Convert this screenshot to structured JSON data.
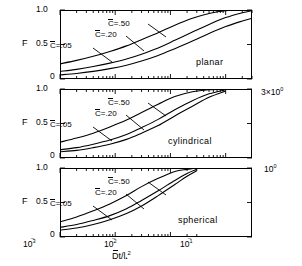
{
  "figure": {
    "type": "multi-panel-line-chart",
    "background": "#ffffff",
    "ink": "#000000",
    "x_axis_title": "D̄t/lₑ²",
    "y_axis_label": "F",
    "y_ticks": [
      "0",
      "0.5",
      "1.0"
    ],
    "x_ticks": [
      "10⁻³",
      "10⁻²",
      "10⁻¹"
    ],
    "x_tick_plain": {
      "t1": "10",
      "t1e": "-3",
      "t2": "10",
      "t2e": "-2",
      "t3": "10",
      "t3e": "-1"
    },
    "right_end_labels": {
      "planar": "3×10⁰",
      "cylindrical": "10⁰"
    },
    "curve_labels": [
      "C̄=.50",
      "C̄=.20",
      "C̄=.05"
    ],
    "curve_label_parts": {
      "sym": "C",
      "eq50": "=.50",
      "eq20": "=.20",
      "eq05": "=.05"
    }
  },
  "panels": [
    {
      "id": "planar",
      "geometry_label": "planar",
      "y_label": "F",
      "y_ticks": [
        "1.0",
        "0.5",
        "0"
      ],
      "right_label": "3×10⁰",
      "curve_labels": [
        "C̄=.50",
        "C̄=.20",
        "C̄=.05"
      ]
    },
    {
      "id": "cylindrical",
      "geometry_label": "cylindrical",
      "y_label": "F",
      "y_ticks": [
        "1.0",
        "0.5",
        "0"
      ],
      "right_label": "10⁰",
      "curve_labels": [
        "C̄=.50",
        "C̄=.20",
        "C̄=.05"
      ]
    },
    {
      "id": "spherical",
      "geometry_label": "spherical",
      "y_label": "F",
      "y_ticks": [
        "1.0",
        "0.5",
        "0"
      ],
      "right_label": "",
      "curve_labels": [
        "C̄=.50",
        "C̄=.20",
        "C̄=.05"
      ]
    }
  ],
  "chart_data": {
    "type": "line",
    "title": "",
    "xlabel": "D̄t/lₑ²",
    "ylabel": "F",
    "xscale": "log",
    "xlim": [
      0.001,
      3.0
    ],
    "ylim": [
      0,
      1.0
    ],
    "xticks": [
      0.001,
      0.01,
      0.1
    ],
    "xticklabels": [
      "10^-3",
      "10^-2",
      "10^-1"
    ],
    "yticks": [
      0,
      0.5,
      1.0
    ],
    "yticklabels": [
      "0",
      "0.5",
      "1.0"
    ],
    "grid": false,
    "legend": "inline-annotations",
    "panels": [
      {
        "name": "planar",
        "xlim": [
          0.001,
          3.0
        ],
        "series": [
          {
            "name": "C̄=.50",
            "x": [
              0.001,
              0.002,
              0.004,
              0.008,
              0.016,
              0.03,
              0.06,
              0.12,
              0.25,
              0.5,
              1.0,
              2.0,
              3.0
            ],
            "y": [
              0.22,
              0.27,
              0.33,
              0.4,
              0.48,
              0.57,
              0.67,
              0.78,
              0.88,
              0.95,
              0.99,
              1.0,
              1.0
            ]
          },
          {
            "name": "C̄=.20",
            "x": [
              0.001,
              0.002,
              0.004,
              0.008,
              0.016,
              0.03,
              0.06,
              0.12,
              0.25,
              0.5,
              1.0,
              2.0,
              3.0
            ],
            "y": [
              0.11,
              0.14,
              0.18,
              0.23,
              0.29,
              0.36,
              0.45,
              0.56,
              0.68,
              0.79,
              0.89,
              0.96,
              0.99
            ]
          },
          {
            "name": "C̄=.05",
            "x": [
              0.001,
              0.002,
              0.004,
              0.008,
              0.016,
              0.03,
              0.06,
              0.12,
              0.25,
              0.5,
              1.0,
              2.0,
              3.0
            ],
            "y": [
              0.06,
              0.08,
              0.11,
              0.15,
              0.2,
              0.26,
              0.34,
              0.44,
              0.55,
              0.66,
              0.76,
              0.84,
              0.88
            ]
          }
        ]
      },
      {
        "name": "cylindrical",
        "xlim": [
          0.001,
          1.0
        ],
        "series": [
          {
            "name": "C̄=.50",
            "x": [
              0.001,
              0.002,
              0.004,
              0.008,
              0.016,
              0.03,
              0.06,
              0.12,
              0.25,
              0.5,
              1.0
            ],
            "y": [
              0.23,
              0.29,
              0.36,
              0.45,
              0.55,
              0.66,
              0.78,
              0.89,
              0.96,
              0.99,
              1.0
            ]
          },
          {
            "name": "C̄=.20",
            "x": [
              0.001,
              0.002,
              0.004,
              0.008,
              0.016,
              0.03,
              0.06,
              0.12,
              0.25,
              0.5,
              1.0
            ],
            "y": [
              0.12,
              0.15,
              0.2,
              0.26,
              0.34,
              0.44,
              0.56,
              0.7,
              0.83,
              0.93,
              0.99
            ]
          },
          {
            "name": "C̄=.05",
            "x": [
              0.001,
              0.002,
              0.004,
              0.008,
              0.016,
              0.03,
              0.06,
              0.12,
              0.25,
              0.5,
              1.0
            ],
            "y": [
              0.09,
              0.11,
              0.15,
              0.2,
              0.27,
              0.36,
              0.47,
              0.61,
              0.75,
              0.88,
              0.97
            ]
          }
        ]
      },
      {
        "name": "spherical",
        "xlim": [
          0.001,
          0.3
        ],
        "series": [
          {
            "name": "C̄=.50",
            "x": [
              0.001,
              0.002,
              0.004,
              0.008,
              0.016,
              0.03,
              0.06,
              0.12,
              0.2,
              0.3
            ],
            "y": [
              0.22,
              0.29,
              0.38,
              0.48,
              0.6,
              0.73,
              0.85,
              0.95,
              0.98,
              1.0
            ]
          },
          {
            "name": "C̄=.20",
            "x": [
              0.001,
              0.002,
              0.004,
              0.008,
              0.016,
              0.03,
              0.06,
              0.12,
              0.2,
              0.3
            ],
            "y": [
              0.14,
              0.18,
              0.24,
              0.31,
              0.41,
              0.53,
              0.67,
              0.82,
              0.92,
              0.98
            ]
          },
          {
            "name": "C̄=.05",
            "x": [
              0.001,
              0.002,
              0.004,
              0.008,
              0.016,
              0.03,
              0.06,
              0.12,
              0.2,
              0.3
            ],
            "y": [
              0.1,
              0.13,
              0.18,
              0.25,
              0.34,
              0.45,
              0.6,
              0.76,
              0.88,
              0.96
            ]
          }
        ]
      }
    ]
  }
}
